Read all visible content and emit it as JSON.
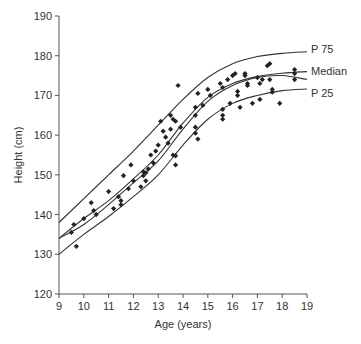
{
  "chart_data": {
    "type": "scatter",
    "title": "",
    "xlabel": "Age (years)",
    "ylabel": "Height (cm)",
    "xlim": [
      9,
      19
    ],
    "ylim": [
      120,
      190
    ],
    "x_ticks": [
      9,
      10,
      11,
      12,
      13,
      14,
      15,
      16,
      17,
      18,
      19
    ],
    "y_ticks": [
      120,
      130,
      140,
      150,
      160,
      170,
      180,
      190
    ],
    "grid": false,
    "legend": "inline labels at right end of curves",
    "series": [
      {
        "name": "P 75",
        "kind": "line",
        "label": "P 75",
        "x": [
          9,
          10,
          11,
          12,
          13,
          14,
          15,
          16,
          17,
          18,
          19
        ],
        "y": [
          138,
          144,
          150,
          156,
          162.5,
          169,
          174.5,
          178,
          179.8,
          180.6,
          181
        ]
      },
      {
        "name": "Median",
        "kind": "line",
        "label": "Median",
        "x": [
          9,
          10,
          11,
          12,
          13,
          14,
          15,
          16,
          17,
          18,
          19
        ],
        "y": [
          134,
          139,
          143.5,
          149,
          155,
          163,
          169.5,
          173,
          174.8,
          175.6,
          176
        ]
      },
      {
        "name": "Fitted",
        "kind": "line",
        "label": "",
        "x": [
          9,
          10,
          11,
          12,
          13,
          14,
          15,
          16,
          17,
          18,
          19
        ],
        "y": [
          134,
          137.5,
          142.5,
          148,
          153.5,
          161.5,
          168.5,
          172.5,
          174.5,
          175,
          174
        ]
      },
      {
        "name": "P 25",
        "kind": "line",
        "label": "P 25",
        "x": [
          9,
          10,
          11,
          12,
          13,
          14,
          15,
          16,
          17,
          18,
          19
        ],
        "y": [
          130,
          135,
          139.5,
          144.5,
          150,
          157.5,
          164,
          168,
          170,
          171.2,
          171.6
        ]
      },
      {
        "name": "Observations",
        "kind": "scatter",
        "points": [
          [
            9.5,
            135.5
          ],
          [
            9.6,
            137.5
          ],
          [
            9.7,
            132
          ],
          [
            10.0,
            139
          ],
          [
            10.3,
            143
          ],
          [
            10.4,
            141
          ],
          [
            10.5,
            140
          ],
          [
            11.0,
            145.8
          ],
          [
            11.2,
            141.5
          ],
          [
            11.4,
            144.5
          ],
          [
            11.5,
            142.5
          ],
          [
            11.5,
            143.5
          ],
          [
            11.6,
            149.8
          ],
          [
            11.8,
            146.5
          ],
          [
            11.9,
            152.5
          ],
          [
            12.0,
            148.5
          ],
          [
            12.3,
            147
          ],
          [
            12.4,
            149.8
          ],
          [
            12.4,
            150.8
          ],
          [
            12.5,
            150.5
          ],
          [
            12.5,
            148.5
          ],
          [
            12.6,
            151.5
          ],
          [
            12.7,
            155
          ],
          [
            12.8,
            153
          ],
          [
            12.9,
            156
          ],
          [
            13.0,
            157.5
          ],
          [
            13.1,
            163.5
          ],
          [
            13.2,
            161
          ],
          [
            13.3,
            159.5
          ],
          [
            13.4,
            158
          ],
          [
            13.5,
            165
          ],
          [
            13.5,
            161.5
          ],
          [
            13.6,
            164
          ],
          [
            13.6,
            155
          ],
          [
            13.7,
            154.8
          ],
          [
            13.7,
            152.5
          ],
          [
            13.7,
            163.5
          ],
          [
            13.8,
            172.5
          ],
          [
            13.9,
            162
          ],
          [
            14.5,
            167
          ],
          [
            14.5,
            165
          ],
          [
            14.5,
            162
          ],
          [
            14.5,
            160.5
          ],
          [
            14.6,
            170.5
          ],
          [
            14.6,
            159
          ],
          [
            14.8,
            167.5
          ],
          [
            15.0,
            171.5
          ],
          [
            15.1,
            170
          ],
          [
            15.5,
            173
          ],
          [
            15.6,
            172
          ],
          [
            15.6,
            166.5
          ],
          [
            15.6,
            165
          ],
          [
            15.6,
            164
          ],
          [
            15.8,
            174
          ],
          [
            15.9,
            168
          ],
          [
            16.0,
            175
          ],
          [
            16.1,
            175.5
          ],
          [
            16.2,
            170
          ],
          [
            16.2,
            171
          ],
          [
            16.3,
            167
          ],
          [
            16.5,
            175.5
          ],
          [
            16.5,
            175
          ],
          [
            16.6,
            172.5
          ],
          [
            16.6,
            173
          ],
          [
            16.8,
            168
          ],
          [
            17.0,
            174.5
          ],
          [
            17.1,
            173
          ],
          [
            17.1,
            169
          ],
          [
            17.2,
            174
          ],
          [
            17.4,
            177.5
          ],
          [
            17.5,
            178
          ],
          [
            17.5,
            174
          ],
          [
            17.6,
            171.5
          ],
          [
            17.6,
            170.8
          ],
          [
            17.9,
            168
          ],
          [
            18.5,
            176.5
          ],
          [
            18.5,
            175.5
          ],
          [
            18.5,
            174
          ]
        ]
      }
    ]
  },
  "labels": {
    "x_axis_title": "Age (years)",
    "y_axis_title": "Height (cm)",
    "p75": "P 75",
    "median": "Median",
    "p25": "P 25"
  }
}
